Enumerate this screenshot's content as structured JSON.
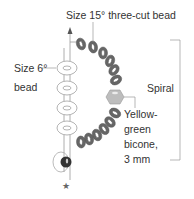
{
  "labels": {
    "three_cut": "Size 15° three-cut bead",
    "size6_line1": "Size 6°",
    "size6_line2": "bead",
    "spiral": "Spiral",
    "bicone_line1": "Yellow-",
    "bicone_line2": "green",
    "bicone_line3": "bicone,",
    "bicone_line4": "3 mm"
  },
  "colors": {
    "text": "#333333",
    "bead_dark": "#666666",
    "bead_outline": "#aaaaaa",
    "bicone": "#bdbdbd",
    "thread": "#999999"
  }
}
